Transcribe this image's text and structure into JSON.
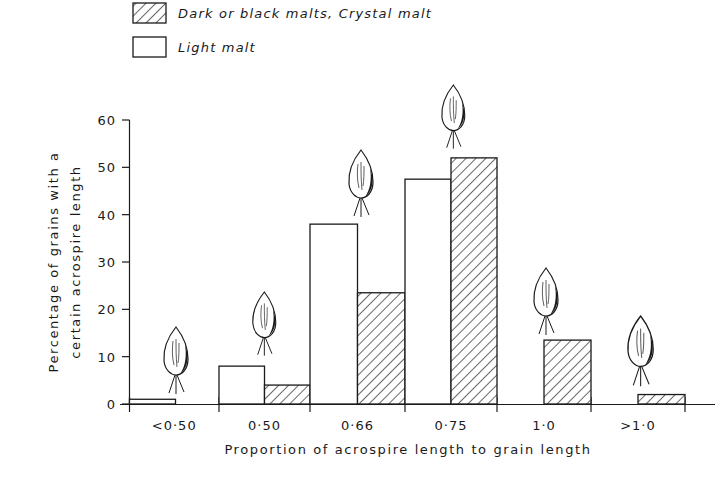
{
  "legend": {
    "items": [
      {
        "label": "Dark or black malts, Crystal malt",
        "pattern": "hatched"
      },
      {
        "label": "Light malt",
        "pattern": "open"
      }
    ]
  },
  "axes": {
    "ylabel_line1": "Percentage of grains with a",
    "ylabel_line2": "certain acrospire length",
    "xlabel": "Proportion of acrospire length to grain length",
    "yticks": [
      "0",
      "10",
      "20",
      "30",
      "40",
      "50",
      "60"
    ]
  },
  "chart_data": {
    "type": "bar",
    "title": "",
    "xlabel": "Proportion of acrospire length to grain length",
    "ylabel": "Percentage of grains with a certain acrospire length",
    "categories": [
      "<0·50",
      "0·50",
      "0·66",
      "0·75",
      "1·0",
      ">1·0"
    ],
    "series": [
      {
        "name": "Light malt",
        "style": "open",
        "values": [
          1,
          8,
          38,
          47.5,
          0,
          0
        ]
      },
      {
        "name": "Dark or black malts, Crystal malt",
        "style": "hatched",
        "values": [
          0,
          4,
          23.5,
          52,
          13.5,
          2
        ]
      }
    ],
    "ylim": [
      0,
      60
    ],
    "yticks": [
      0,
      10,
      20,
      30,
      40,
      50,
      60
    ],
    "grid": false,
    "legend_position": "top-left",
    "annotations": [
      "grain illustration above each category showing acrospire length"
    ]
  },
  "colors": {
    "ink": "#1a1a1a",
    "background": "#ffffff"
  }
}
